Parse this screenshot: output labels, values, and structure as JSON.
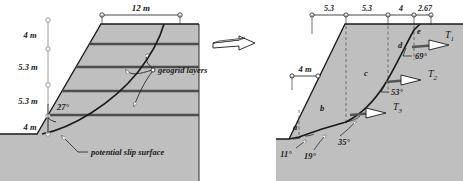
{
  "figure": {
    "type": "geotechnical-slope-stability-diagram",
    "background_color": "#ffffff",
    "soil_fill_color": "#bfbfbf",
    "line_color": "#1a1a1a",
    "geogrid_color": "#4d4d4d"
  },
  "left_diagram": {
    "name": "reinforced-slope-cross-section",
    "crest_dimension": "12 m",
    "slope_angle": "27°",
    "vertical_dimensions": [
      "4 m",
      "5.3 m",
      "5.3 m",
      "4 m"
    ],
    "annotations": {
      "geogrid_layers": "geogrid layers",
      "potential_slip_surface": "potential slip surface"
    },
    "geogrid_layer_count": 4
  },
  "transition_arrow": {
    "name": "block-arrow-right",
    "direction": "right"
  },
  "right_diagram": {
    "name": "wedge-analysis-section",
    "top_dimensions": [
      "5.3",
      "5.3",
      "4",
      "2.67"
    ],
    "height_dimension": "4 m",
    "wedge_labels": [
      "a",
      "b",
      "c",
      "d",
      "e"
    ],
    "base_angles": [
      "11°",
      "19°",
      "35°",
      "53°",
      "69°"
    ],
    "tension_forces": [
      {
        "label": "T",
        "sub": "1"
      },
      {
        "label": "T",
        "sub": "2"
      },
      {
        "label": "T",
        "sub": "3"
      }
    ]
  }
}
